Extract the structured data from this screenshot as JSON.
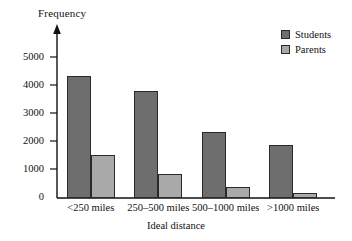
{
  "chart_data": {
    "type": "bar",
    "title": "",
    "xlabel": "Ideal distance",
    "ylabel": "Frequency",
    "categories": [
      "<250 miles",
      "250–500 miles",
      "500–1000 miles",
      ">1000 miles"
    ],
    "series": [
      {
        "name": "Students",
        "color": "#6e6e6e",
        "values": [
          4500,
          3950,
          2450,
          1950
        ]
      },
      {
        "name": "Parents",
        "color": "#a9a9a9",
        "values": [
          1600,
          900,
          400,
          200
        ]
      }
    ],
    "ylim": [
      0,
      5400
    ],
    "yticks": [
      0,
      1000,
      2000,
      3000,
      4000,
      5000
    ],
    "ytick_labels": [
      "0",
      "1000",
      "2000",
      "3000",
      "4000",
      "5000"
    ],
    "grid": false,
    "legend_position": "top-right",
    "axis_style": "arrow-headed-y-axis"
  },
  "axes": {
    "y_title": "Frequency",
    "x_title": "Ideal distance"
  },
  "legend": {
    "entries": [
      {
        "label": "Students"
      },
      {
        "label": "Parents"
      }
    ]
  },
  "ytick_labels": {
    "t0": "0",
    "t1": "1000",
    "t2": "2000",
    "t3": "3000",
    "t4": "4000",
    "t5": "5000"
  },
  "xtick_labels": {
    "c0": "<250 miles",
    "c1": "250–500 miles",
    "c2": "500–1000 miles",
    "c3": ">1000 miles"
  }
}
